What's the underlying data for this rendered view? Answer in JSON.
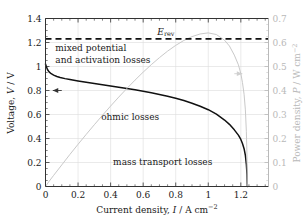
{
  "chart_data": {
    "type": "line",
    "title": "",
    "xlabel": "Current density, I / A cm⁻²",
    "ylabel": "Voltage, V / V",
    "y2label": "Power density, P / W cm⁻²",
    "xlim": [
      0,
      1.37
    ],
    "ylim": [
      0,
      1.4
    ],
    "y2lim": [
      0,
      0.7
    ],
    "grid": true,
    "legend_position": "none",
    "xticks": [
      0,
      0.2,
      0.4,
      0.6,
      0.8,
      1,
      1.2
    ],
    "xtick_labels": [
      "0",
      "0.2",
      "0.4",
      "0.6",
      "0.8",
      "1",
      "1.2"
    ],
    "yticks": [
      0,
      0.2,
      0.4,
      0.6,
      0.8,
      1,
      1.2,
      1.4
    ],
    "ytick_labels": [
      "0",
      "0.2",
      "0.4",
      "0.6",
      "0.8",
      "1",
      "1.2",
      "1.4"
    ],
    "y2ticks": [
      0,
      0.1,
      0.2,
      0.3,
      0.4,
      0.5,
      0.6,
      0.7
    ],
    "y2tick_labels": [
      "0",
      "0.1",
      "0.2",
      "0.3",
      "0.4",
      "0.5",
      "0.6",
      "0.7"
    ],
    "series": [
      {
        "name": "Polarisation curve",
        "axis": "left",
        "color": "#111111",
        "style": "solid",
        "x": [
          0,
          0.005,
          0.012,
          0.022,
          0.035,
          0.05,
          0.07,
          0.09,
          0.12,
          0.15,
          0.2,
          0.25,
          0.3,
          0.35,
          0.4,
          0.45,
          0.5,
          0.55,
          0.6,
          0.65,
          0.7,
          0.75,
          0.8,
          0.85,
          0.9,
          0.95,
          1.0,
          1.05,
          1.1,
          1.13,
          1.16,
          1.185,
          1.2,
          1.21,
          1.22,
          1.228,
          1.234,
          1.238,
          1.24
        ],
        "y": [
          1.02,
          1.0,
          0.975,
          0.955,
          0.94,
          0.928,
          0.917,
          0.909,
          0.899,
          0.891,
          0.879,
          0.868,
          0.858,
          0.848,
          0.838,
          0.828,
          0.817,
          0.806,
          0.794,
          0.781,
          0.767,
          0.752,
          0.735,
          0.716,
          0.694,
          0.669,
          0.64,
          0.603,
          0.554,
          0.518,
          0.472,
          0.428,
          0.392,
          0.358,
          0.315,
          0.26,
          0.185,
          0.1,
          0.0
        ]
      },
      {
        "name": "Power density curve",
        "axis": "right",
        "color": "#c9c9c9",
        "style": "solid",
        "x": [
          0,
          0.02,
          0.05,
          0.1,
          0.15,
          0.2,
          0.25,
          0.3,
          0.35,
          0.4,
          0.45,
          0.5,
          0.55,
          0.6,
          0.65,
          0.7,
          0.75,
          0.8,
          0.85,
          0.9,
          0.95,
          1.0,
          1.05,
          1.1,
          1.13,
          1.16,
          1.185,
          1.2,
          1.21,
          1.22,
          1.228,
          1.234,
          1.238,
          1.24
        ],
        "y": [
          0.0,
          0.0195,
          0.0464,
          0.0899,
          0.1337,
          0.1758,
          0.217,
          0.2574,
          0.2968,
          0.3352,
          0.3726,
          0.4085,
          0.4433,
          0.4764,
          0.5077,
          0.5369,
          0.564,
          0.588,
          0.6086,
          0.6246,
          0.6356,
          0.64,
          0.6332,
          0.6094,
          0.5853,
          0.5475,
          0.5072,
          0.4704,
          0.4332,
          0.3843,
          0.3193,
          0.2283,
          0.1238,
          0.0
        ]
      }
    ],
    "reference_lines": [
      {
        "name": "E_rev",
        "label": "Eᵣₑᵥ",
        "label_plain": "Erev",
        "axis": "left",
        "value": 1.23,
        "style": "dashed",
        "color": "#111111"
      }
    ],
    "annotations": [
      {
        "name": "mixed-potential-annotation",
        "line1": "mixed potential",
        "line2": "and activation losses",
        "x": 0.06,
        "y": 1.16
      },
      {
        "name": "ohmic-losses-annotation",
        "text": "ohmic losses",
        "x": 0.52,
        "y": 0.585
      },
      {
        "name": "mass-transport-losses-annotation",
        "text": "mass transport losses",
        "x": 0.72,
        "y": 0.215
      }
    ],
    "axis_pointer_arrows": [
      {
        "name": "left-axis-arrow",
        "direction": "left",
        "x": 0.1,
        "y": 0.8
      },
      {
        "name": "right-axis-arrow",
        "direction": "right",
        "x": 1.16,
        "y2": 0.47
      }
    ]
  },
  "labels": {
    "erev_base": "E",
    "erev_sub": "rev",
    "xlabel_pre": "Current density, ",
    "xlabel_var": "I",
    "xlabel_post": " / A cm",
    "xlabel_sup": "−2",
    "ylabel_pre": "Voltage, ",
    "ylabel_var": "V",
    "ylabel_post": " / V",
    "y2label_pre": "Power density, ",
    "y2label_var": "P",
    "y2label_post": " / W cm",
    "y2label_sup": "−2",
    "annot_mixed_line1": "mixed potential",
    "annot_mixed_line2": "and activation losses",
    "annot_ohmic": "ohmic losses",
    "annot_mass": "mass transport losses"
  },
  "colors": {
    "voltage_curve": "#111111",
    "power_curve": "#c9c9c9",
    "grid": "#dcdcdc",
    "axis": "#333333",
    "right_axis_text": "#b9b9b9",
    "background": "#ffffff"
  }
}
